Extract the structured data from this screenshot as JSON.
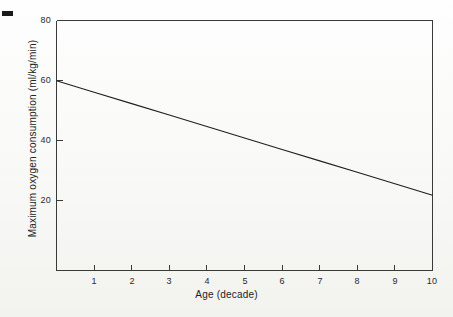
{
  "figure": {
    "marks": {
      "corner_mark": "crop-registration-dash"
    }
  },
  "chart_data": {
    "type": "line",
    "title": "",
    "xlabel": "Age (decade)",
    "ylabel": "Maximum oxygen consumption (ml/kg/min)",
    "xlim": [
      0,
      10
    ],
    "ylim": [
      -3,
      80
    ],
    "grid": false,
    "legend": null,
    "xticks": [
      1,
      2,
      3,
      4,
      5,
      6,
      7,
      8,
      9,
      10
    ],
    "xtick_labels": [
      "1",
      "2",
      "3",
      "4",
      "5",
      "6",
      "7",
      "8",
      "9",
      "10"
    ],
    "yticks": [
      20,
      40,
      60,
      80
    ],
    "ytick_labels": [
      "20",
      "40",
      "60",
      "80"
    ],
    "series": [
      {
        "name": "Maximum oxygen consumption",
        "color": "#1f1f1f",
        "x": [
          0,
          1,
          2,
          3,
          4,
          5,
          6,
          7,
          8,
          9,
          10
        ],
        "values": [
          60,
          56.2,
          52.4,
          48.6,
          44.8,
          41,
          37.2,
          33.4,
          29.6,
          25.8,
          22
        ]
      }
    ],
    "annotations": []
  }
}
